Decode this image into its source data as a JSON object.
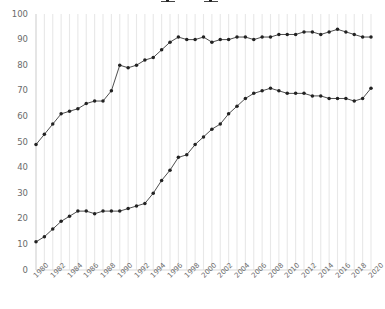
{
  "chart_data": {
    "type": "line",
    "title": "",
    "xlabel": "",
    "ylabel": "",
    "xlim": [
      1980,
      2020
    ],
    "ylim": [
      0,
      100
    ],
    "grid": "vertical",
    "legend_position": "top-center",
    "legend_clipped": true,
    "x": [
      1980,
      1981,
      1982,
      1983,
      1984,
      1985,
      1986,
      1987,
      1988,
      1989,
      1990,
      1991,
      1992,
      1993,
      1994,
      1995,
      1996,
      1997,
      1998,
      1999,
      2000,
      2001,
      2002,
      2003,
      2004,
      2005,
      2006,
      2007,
      2008,
      2009,
      2010,
      2011,
      2012,
      2013,
      2014,
      2015,
      2016,
      2017,
      2018,
      2019,
      2020
    ],
    "xticks": [
      "1980",
      "1982",
      "1984",
      "1986",
      "1988",
      "1990",
      "1992",
      "1994",
      "1996",
      "1998",
      "2000",
      "2002",
      "2004",
      "2006",
      "2008",
      "2010",
      "2012",
      "2014",
      "2016",
      "2018",
      "2020"
    ],
    "yticks": [
      "0",
      "10",
      "20",
      "30",
      "40",
      "50",
      "60",
      "70",
      "80",
      "90",
      "100"
    ],
    "series": [
      {
        "name": "series-upper",
        "marker": "circle",
        "color": "#3a3a3a",
        "values": [
          49,
          53,
          57,
          61,
          62,
          63,
          65,
          66,
          66,
          70,
          80,
          79,
          80,
          82,
          83,
          86,
          89,
          91,
          90,
          90,
          91,
          89,
          90,
          90,
          91,
          91,
          90,
          91,
          91,
          92,
          92,
          92,
          93,
          93,
          92,
          93,
          94,
          93,
          92,
          91,
          91
        ]
      },
      {
        "name": "series-lower",
        "marker": "circle",
        "color": "#3a3a3a",
        "values": [
          11,
          13,
          16,
          19,
          21,
          23,
          23,
          22,
          23,
          23,
          23,
          24,
          25,
          26,
          30,
          35,
          39,
          44,
          45,
          49,
          52,
          55,
          57,
          61,
          64,
          67,
          69,
          70,
          71,
          70,
          69,
          69,
          69,
          68,
          68,
          67,
          67,
          67,
          66,
          67,
          71
        ]
      }
    ]
  },
  "axes": {
    "y_tick_labels": [
      "100",
      "90",
      "80",
      "70",
      "60",
      "50",
      "40",
      "30",
      "20",
      "10",
      "0"
    ],
    "x_tick_labels": [
      "1980",
      "1982",
      "1984",
      "1986",
      "1988",
      "1990",
      "1992",
      "1994",
      "1996",
      "1998",
      "2000",
      "2002",
      "2004",
      "2006",
      "2008",
      "2010",
      "2012",
      "2014",
      "2016",
      "2018",
      "2020"
    ]
  },
  "legend": {
    "entries": [
      {
        "label": ""
      },
      {
        "label": ""
      }
    ]
  },
  "colors": {
    "line": "#3a3a3a",
    "marker": "#222222",
    "grid": "#e8e8e8",
    "tick_text": "#6b6b6b",
    "background": "#ffffff"
  }
}
